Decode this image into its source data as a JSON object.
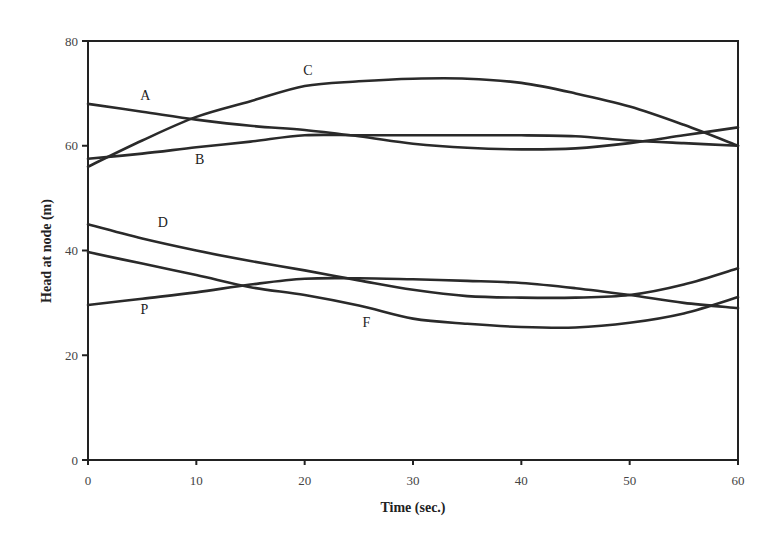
{
  "chart_data": {
    "type": "line",
    "title": "",
    "xlabel": "Time (sec.)",
    "ylabel": "Head at node (m)",
    "xlim": [
      0,
      60
    ],
    "ylim": [
      0,
      80
    ],
    "x_ticks": [
      0,
      10,
      20,
      30,
      40,
      50,
      60
    ],
    "y_ticks": [
      0,
      20,
      40,
      60,
      80
    ],
    "grid": false,
    "legend": "inline labels",
    "x": [
      0,
      5,
      10,
      15,
      20,
      25,
      30,
      35,
      40,
      45,
      50,
      55,
      60
    ],
    "series": [
      {
        "name": "A",
        "values": [
          68,
          66.5,
          65,
          63.8,
          63,
          61.8,
          60.4,
          59.6,
          59.3,
          59.5,
          60.5,
          62,
          63.5
        ],
        "label_pos": [
          5.3,
          68.8
        ]
      },
      {
        "name": "B",
        "values": [
          57.5,
          58.5,
          59.7,
          60.8,
          62,
          62,
          62,
          62,
          62,
          61.8,
          61,
          60.5,
          60
        ],
        "label_pos": [
          10.3,
          56.5
        ]
      },
      {
        "name": "C",
        "values": [
          56,
          61,
          65.5,
          68.5,
          71.4,
          72.3,
          72.8,
          72.8,
          72,
          70,
          67.5,
          64,
          60
        ],
        "label_pos": [
          20.3,
          73.6
        ]
      },
      {
        "name": "D",
        "values": [
          45,
          42.3,
          40,
          38,
          36.2,
          34.3,
          32.5,
          31.3,
          31,
          31,
          31.5,
          33.5,
          36.6
        ],
        "label_pos": [
          6.9,
          44.5
        ]
      },
      {
        "name": "F",
        "values": [
          39.7,
          37.5,
          35.3,
          33,
          31.5,
          29.5,
          27,
          26,
          25.4,
          25.3,
          26.2,
          28,
          31.1
        ],
        "label_pos": [
          25.7,
          25.3
        ]
      },
      {
        "name": "P",
        "values": [
          29.6,
          30.8,
          32,
          33.5,
          34.6,
          34.7,
          34.5,
          34.2,
          33.8,
          32.8,
          31.5,
          30,
          29
        ],
        "label_pos": [
          5.2,
          27.9
        ]
      }
    ]
  },
  "style": {
    "line_color": "#2a2a2a",
    "axis_color": "#222222",
    "background": "#ffffff"
  }
}
